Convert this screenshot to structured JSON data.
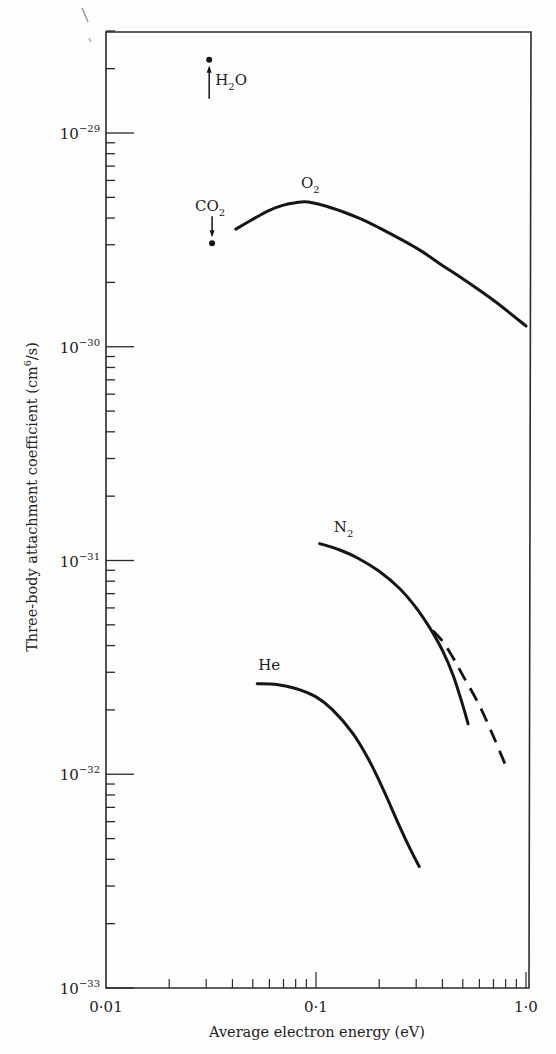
{
  "chart_data": {
    "type": "line",
    "title": "",
    "xlabel": "Average electron energy (eV)",
    "ylabel": "Three-body attachment coefficient (cm6/s)",
    "ylabel_parts": {
      "main": "Three-body attachment coefficient (cm",
      "sup": "6",
      "tail": "/s)"
    },
    "x_scale": "log",
    "y_scale": "log",
    "xlim": [
      0.01,
      1.0
    ],
    "ylim": [
      1e-33,
      3e-29
    ],
    "x_tick_labels": [
      "0·01",
      "0·1",
      "1·0"
    ],
    "x_ticks": [
      0.01,
      0.1,
      1.0
    ],
    "y_tick_labels": [
      {
        "base": "10",
        "exp": "−29",
        "value": 1e-29
      },
      {
        "base": "10",
        "exp": "−30",
        "value": 1e-30
      },
      {
        "base": "10",
        "exp": "−31",
        "value": 1e-31
      },
      {
        "base": "10",
        "exp": "−32",
        "value": 1e-32
      },
      {
        "base": "10",
        "exp": "−33",
        "value": 1e-33
      }
    ],
    "grid": false,
    "legend": "none (curves labelled directly)",
    "series": [
      {
        "name": "O2",
        "label": "O",
        "label_sub": "2",
        "style": "solid",
        "x": [
          0.0415,
          0.05,
          0.06,
          0.07,
          0.08,
          0.092,
          0.12,
          0.16,
          0.2,
          0.3,
          0.4,
          0.5,
          0.7,
          1.0
        ],
        "y": [
          3.55e-30,
          3.95e-30,
          4.35e-30,
          4.6e-30,
          4.72e-30,
          4.75e-30,
          4.45e-30,
          4e-30,
          3.6e-30,
          2.9e-30,
          2.4e-30,
          2.08e-30,
          1.65e-30,
          1.25e-30
        ]
      },
      {
        "name": "N2",
        "label": "N",
        "label_sub": "2",
        "style": "solid",
        "x": [
          0.104,
          0.13,
          0.16,
          0.2,
          0.25,
          0.3,
          0.35,
          0.4,
          0.45,
          0.5,
          0.53
        ],
        "y": [
          1.2e-31,
          1.12e-31,
          1.02e-31,
          8.9e-32,
          7.4e-32,
          6e-32,
          4.8e-32,
          3.8e-32,
          2.9e-32,
          2.1e-32,
          1.72e-32
        ]
      },
      {
        "name": "N2 (dashed)",
        "style": "dashed",
        "x": [
          0.36,
          0.4,
          0.45,
          0.5,
          0.6,
          0.7,
          0.8
        ],
        "y": [
          4.7e-32,
          4.2e-32,
          3.5e-32,
          2.9e-32,
          2.1e-32,
          1.5e-32,
          1.1e-32
        ]
      },
      {
        "name": "He",
        "label": "He",
        "label_sub": "",
        "style": "solid",
        "x": [
          0.0525,
          0.065,
          0.08,
          0.1,
          0.12,
          0.15,
          0.18,
          0.21,
          0.25,
          0.28,
          0.31
        ],
        "y": [
          2.65e-32,
          2.63e-32,
          2.52e-32,
          2.3e-32,
          2e-32,
          1.55e-32,
          1.15e-32,
          8.4e-33,
          5.7e-33,
          4.5e-33,
          3.7e-33
        ]
      }
    ],
    "points": [
      {
        "name": "H2O",
        "label": "H",
        "label_sub": "2",
        "label_tail": "O",
        "x": 0.031,
        "y": 2.2e-29,
        "arrow": "up"
      },
      {
        "name": "CO2",
        "label": "CO",
        "label_sub": "2",
        "label_tail": "",
        "x": 0.032,
        "y": 3.05e-30,
        "arrow": "down"
      }
    ]
  }
}
